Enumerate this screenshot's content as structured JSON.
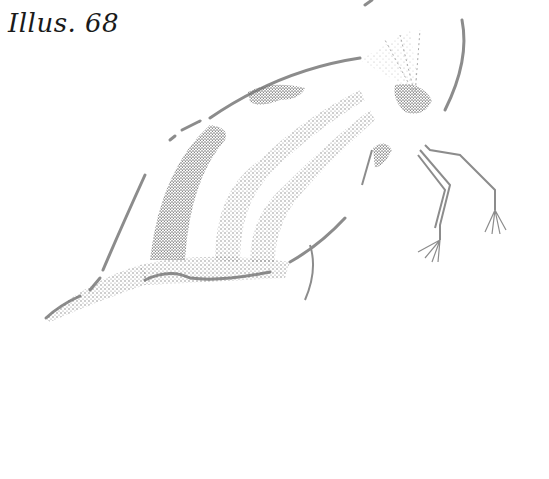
{
  "caption": {
    "text": "Illus. 68"
  },
  "illustration": {
    "subject": "stippled insect drawing (treehopper side view)",
    "ink_color": "#8a8a8a",
    "background": "#ffffff"
  }
}
